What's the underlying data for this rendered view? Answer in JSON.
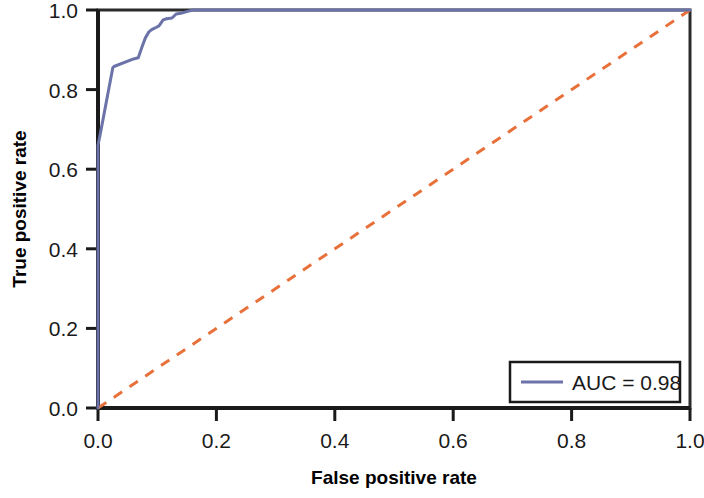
{
  "chart_data": {
    "type": "line",
    "title": "",
    "xlabel": "False positive rate",
    "ylabel": "True positive rate",
    "xlim": [
      0.0,
      1.0
    ],
    "ylim": [
      0.0,
      1.0
    ],
    "grid": false,
    "xticks": [
      "0.0",
      "0.2",
      "0.4",
      "0.6",
      "0.8",
      "1.0"
    ],
    "yticks": [
      "0.0",
      "0.2",
      "0.4",
      "0.6",
      "0.8",
      "1.0"
    ],
    "xtick_values": [
      0.0,
      0.2,
      0.4,
      0.6,
      0.8,
      1.0
    ],
    "ytick_values": [
      0.0,
      0.2,
      0.4,
      0.6,
      0.8,
      1.0
    ],
    "legend_position": "lower right",
    "series": [
      {
        "name": "AUC = 0.98",
        "style": "solid",
        "color": "#6b73a8",
        "x": [
          0.0,
          0.0,
          0.004,
          0.025,
          0.027,
          0.06,
          0.068,
          0.074,
          0.08,
          0.086,
          0.09,
          0.094,
          0.098,
          0.103,
          0.11,
          0.116,
          0.125,
          0.132,
          0.14,
          0.15,
          0.16,
          0.168,
          1.0
        ],
        "y": [
          0.0,
          0.66,
          0.69,
          0.855,
          0.858,
          0.877,
          0.88,
          0.906,
          0.93,
          0.945,
          0.95,
          0.953,
          0.956,
          0.96,
          0.975,
          0.978,
          0.98,
          0.99,
          0.992,
          0.996,
          1.0,
          1.0,
          1.0
        ]
      },
      {
        "name": "chance",
        "style": "dashed",
        "color": "#e8703a",
        "x": [
          0.0,
          1.0
        ],
        "y": [
          0.0,
          1.0
        ]
      }
    ],
    "legend_entries": [
      {
        "label": "AUC = 0.98",
        "color": "#6b73a8",
        "style": "solid"
      }
    ],
    "annotations": {
      "auc_value": "0.98"
    }
  },
  "colors": {
    "roc_curve": "#6b73a8",
    "chance_line": "#e8703a",
    "axis": "#1a1a1a",
    "frame": "#2b2b2b",
    "text": "#1a1a1a",
    "background": "#ffffff"
  }
}
